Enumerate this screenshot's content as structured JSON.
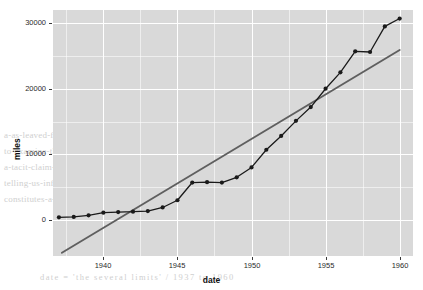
{
  "chart_data": {
    "type": "line",
    "title": "",
    "subtitle": "",
    "xlabel": "date",
    "ylabel": "miles",
    "xlim": [
      1936.6,
      1960.9
    ],
    "ylim": [
      -5500,
      32000
    ],
    "grid": true,
    "legend": "none",
    "x_ticks": [
      "1940",
      "1945",
      "1950",
      "1955",
      "1960"
    ],
    "x_tick_values": [
      1940,
      1945,
      1950,
      1955,
      1960
    ],
    "y_ticks": [
      "0",
      "10000",
      "20000",
      "30000"
    ],
    "y_tick_values": [
      0,
      10000,
      20000,
      30000
    ],
    "series": [
      {
        "name": "miles",
        "type": "line-with-points",
        "color": "#1a1a1a",
        "point_color": "#1a1a1a",
        "x": [
          1937,
          1938,
          1939,
          1940,
          1941,
          1942,
          1943,
          1944,
          1945,
          1946,
          1947,
          1948,
          1949,
          1950,
          1951,
          1952,
          1953,
          1954,
          1955,
          1956,
          1957,
          1958,
          1959,
          1960
        ],
        "values": [
          400,
          450,
          700,
          1100,
          1200,
          1250,
          1350,
          1900,
          3000,
          5700,
          5750,
          5700,
          6500,
          8000,
          10700,
          12800,
          15100,
          17200,
          20000,
          22500,
          25700,
          25600,
          29500,
          30700
        ]
      },
      {
        "name": "trend",
        "type": "line",
        "color": "#5f5f5f",
        "x": [
          1937.2,
          1960.0
        ],
        "values": [
          -5000,
          25900
        ]
      }
    ]
  },
  "background_text": {
    "lines": [
      "a-as-leaved-for-reading-the-same-graphic-representation-and",
      "to-examine-that-a-more-detailed-the-several-senses-of-support",
      "a-tacit-claim-on-that-there-is-a-certain-convention-in-graphic",
      "telling-us-information-about-appearances-to-other-the-remarks",
      "constitutes-a-schematic"
    ],
    "footer": "date = 'the several limits' / 1937 to 1960"
  }
}
